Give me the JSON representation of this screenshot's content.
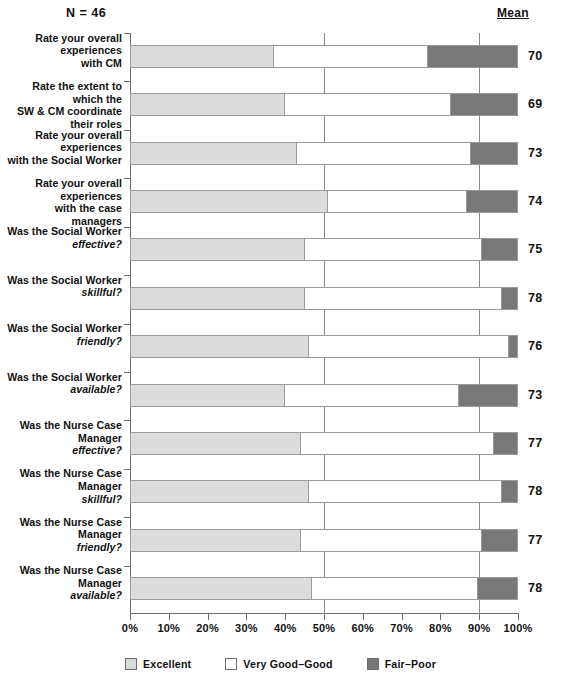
{
  "header": {
    "n_label": "N = 46",
    "mean_header": "Mean"
  },
  "legend": {
    "items": [
      {
        "label": "Excellent",
        "color": "#dcdcdc",
        "name": "excellent"
      },
      {
        "label": "Very Good–Good",
        "color": "#ffffff",
        "name": "very-good-good"
      },
      {
        "label": "Fair–Poor",
        "color": "#787878",
        "name": "fair-poor"
      }
    ]
  },
  "axis": {
    "ticks": [
      "0%",
      "10%",
      "20%",
      "30%",
      "40%",
      "50%",
      "60%",
      "70%",
      "80%",
      "90%",
      "100%"
    ],
    "gridlines": [
      50,
      90
    ]
  },
  "chart_data": {
    "type": "bar",
    "orientation": "horizontal",
    "stacked": true,
    "title": "",
    "subtitle": "N = 46",
    "xlabel": "",
    "ylabel": "",
    "xlim": [
      0,
      100
    ],
    "grid": true,
    "legend_position": "bottom",
    "categories": [
      "Rate your overall experiences with CM",
      "Rate the extent to which the SW & CM coordinate their roles",
      "Rate your overall experiences with the Social Worker",
      "Rate your overall experiences with the case managers",
      "Was the Social Worker effective?",
      "Was the Social Worker skillful?",
      "Was the Social Worker friendly?",
      "Was the Social Worker available?",
      "Was the Nurse Case Manager effective?",
      "Was the Nurse Case Manager skillful?",
      "Was the Nurse Case Manager friendly?",
      "Was the Nurse Case Manager available?"
    ],
    "series": [
      {
        "name": "Excellent",
        "values": [
          37,
          40,
          43,
          51,
          45,
          45,
          46,
          40,
          44,
          46,
          44,
          47
        ]
      },
      {
        "name": "Very Good–Good",
        "values": [
          40,
          43,
          45,
          36,
          46,
          51,
          52,
          45,
          50,
          50,
          47,
          43
        ]
      },
      {
        "name": "Fair–Poor",
        "values": [
          23,
          17,
          12,
          13,
          9,
          4,
          2,
          15,
          6,
          4,
          9,
          10
        ]
      }
    ],
    "means": [
      70,
      69,
      73,
      74,
      75,
      78,
      76,
      73,
      77,
      78,
      77,
      78
    ]
  },
  "rows": [
    {
      "line1": "Rate your overall experiences",
      "line2": "with CM",
      "italic2": false,
      "excellent": 37,
      "verygood": 40,
      "fairpoor": 23,
      "mean": "70"
    },
    {
      "line1": "Rate the extent to which the",
      "line2": "SW & CM coordinate their roles",
      "italic2": false,
      "excellent": 40,
      "verygood": 43,
      "fairpoor": 17,
      "mean": "69"
    },
    {
      "line1": "Rate your overall experiences",
      "line2": "with the Social Worker",
      "italic2": false,
      "excellent": 43,
      "verygood": 45,
      "fairpoor": 12,
      "mean": "73"
    },
    {
      "line1": "Rate your overall experiences",
      "line2": "with the case managers",
      "italic2": false,
      "excellent": 51,
      "verygood": 36,
      "fairpoor": 13,
      "mean": "74"
    },
    {
      "line1": "Was the Social Worker",
      "line2": "effective?",
      "italic2": true,
      "excellent": 45,
      "verygood": 46,
      "fairpoor": 9,
      "mean": "75"
    },
    {
      "line1": "Was the Social Worker",
      "line2": "skillful?",
      "italic2": true,
      "excellent": 45,
      "verygood": 51,
      "fairpoor": 4,
      "mean": "78"
    },
    {
      "line1": "Was the Social Worker",
      "line2": "friendly?",
      "italic2": true,
      "excellent": 46,
      "verygood": 52,
      "fairpoor": 2,
      "mean": "76"
    },
    {
      "line1": "Was the Social Worker",
      "line2": "available?",
      "italic2": true,
      "excellent": 40,
      "verygood": 45,
      "fairpoor": 15,
      "mean": "73"
    },
    {
      "line1": "Was the Nurse Case Manager",
      "line2": "effective?",
      "italic2": true,
      "excellent": 44,
      "verygood": 50,
      "fairpoor": 6,
      "mean": "77"
    },
    {
      "line1": "Was the Nurse Case Manager",
      "line2": "skillful?",
      "italic2": true,
      "excellent": 46,
      "verygood": 50,
      "fairpoor": 4,
      "mean": "78"
    },
    {
      "line1": "Was the Nurse Case Manager",
      "line2": "friendly?",
      "italic2": true,
      "excellent": 44,
      "verygood": 47,
      "fairpoor": 9,
      "mean": "77"
    },
    {
      "line1": "Was the Nurse Case Manager",
      "line2": "available?",
      "italic2": true,
      "excellent": 47,
      "verygood": 43,
      "fairpoor": 10,
      "mean": "78"
    }
  ]
}
